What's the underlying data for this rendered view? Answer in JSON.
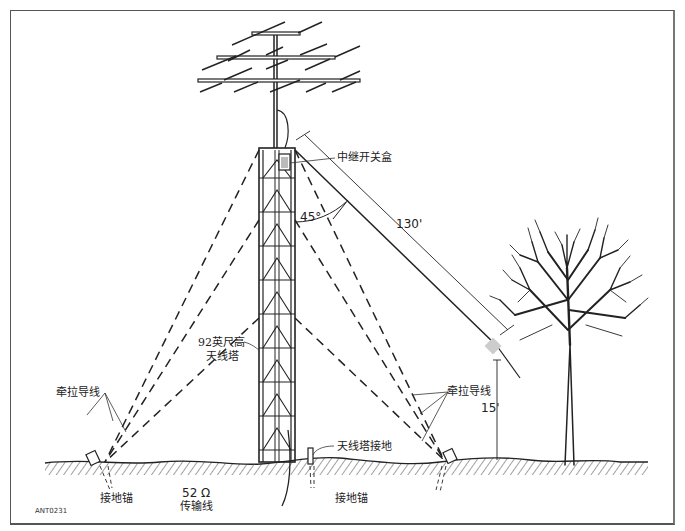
{
  "diagram": {
    "figure_id": "ANT0231",
    "labels": {
      "relay_box": "中继开关盒",
      "angle": "45°",
      "length": "130'",
      "tower_height_line1": "92英尺高",
      "tower_height_line2": "天线塔",
      "guy_wire_left": "牵拉导线",
      "guy_wire_right": "牵拉导线",
      "height": "15'",
      "tower_ground": "天线塔接地",
      "anchor_left": "接地锚",
      "anchor_right": "接地锚",
      "impedance": "52 Ω",
      "feedline": "传输线"
    },
    "colors": {
      "line": "#222222",
      "ground_hatch": "#444444",
      "background": "#ffffff"
    }
  }
}
